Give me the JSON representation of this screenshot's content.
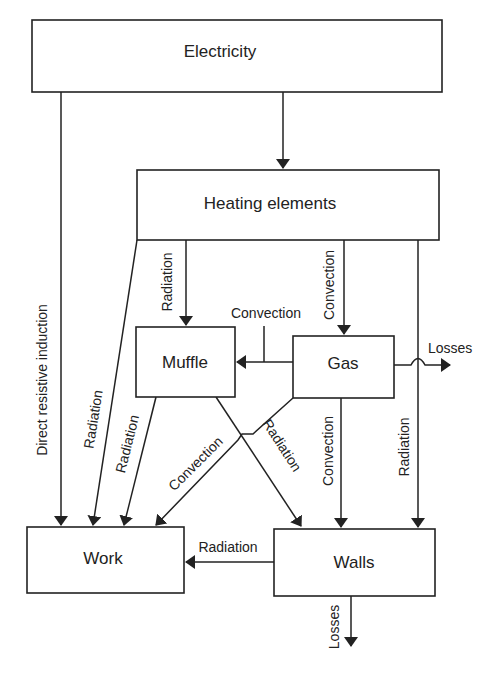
{
  "diagram": {
    "type": "energy-flow",
    "nodes": [
      {
        "id": "electricity",
        "label": "Electricity"
      },
      {
        "id": "heating",
        "label": "Heating elements"
      },
      {
        "id": "muffle",
        "label": "Muffle"
      },
      {
        "id": "gas",
        "label": "Gas"
      },
      {
        "id": "work",
        "label": "Work"
      },
      {
        "id": "walls",
        "label": "Walls"
      }
    ],
    "edges": [
      {
        "from": "electricity",
        "to": "work",
        "label": "Direct resistive induction"
      },
      {
        "from": "electricity",
        "to": "heating",
        "label": ""
      },
      {
        "from": "heating",
        "to": "work",
        "label": "Radiation"
      },
      {
        "from": "heating",
        "to": "muffle",
        "label": "Radiation"
      },
      {
        "from": "heating",
        "to": "gas",
        "label": "Convection"
      },
      {
        "from": "heating",
        "to": "walls",
        "label": "Radiation"
      },
      {
        "from": "gas",
        "to": "muffle",
        "label": "Convection"
      },
      {
        "from": "gas",
        "to": "losses",
        "label": "Losses"
      },
      {
        "from": "muffle",
        "to": "work",
        "label": "Radiation"
      },
      {
        "from": "muffle",
        "to": "walls",
        "label": "Radiation"
      },
      {
        "from": "gas",
        "to": "work",
        "label": "Convection"
      },
      {
        "from": "gas",
        "to": "walls",
        "label": "Convection"
      },
      {
        "from": "walls",
        "to": "work",
        "label": "Radiation"
      },
      {
        "from": "walls",
        "to": "losses",
        "label": "Losses"
      }
    ]
  },
  "labels": {
    "electricity": "Electricity",
    "heating": "Heating elements",
    "muffle": "Muffle",
    "gas": "Gas",
    "work": "Work",
    "walls": "Walls",
    "direct_resistive_induction": "Direct resistive induction",
    "heating_work_radiation": "Radiation",
    "heating_muffle_radiation": "Radiation",
    "heating_gas_convection": "Convection",
    "heating_walls_radiation": "Radiation",
    "gas_muffle_convection": "Convection",
    "gas_losses": "Losses",
    "muffle_work_radiation": "Radiation",
    "muffle_walls_radiation": "Radiation",
    "gas_work_convection": "Convection",
    "gas_walls_convection": "Convection",
    "walls_work_radiation": "Radiation",
    "walls_losses": "Losses"
  },
  "colors": {
    "stroke": "#222222",
    "background": "#ffffff"
  }
}
